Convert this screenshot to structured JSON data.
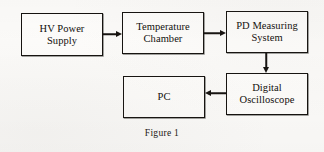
{
  "figure": {
    "caption": "Figure 1",
    "background_color": "#fbfaf8",
    "line_color": "#15120f",
    "box_fill_color": "#fdfcfa"
  },
  "blocks": [
    {
      "id": "hv-power-supply",
      "label": "HV Power\nSupply",
      "x": 21,
      "y": 13,
      "w": 82,
      "h": 43
    },
    {
      "id": "temperature-chamber",
      "label": "Temperature\nChamber",
      "x": 122,
      "y": 12,
      "w": 82,
      "h": 42
    },
    {
      "id": "pd-measuring-system",
      "label": "PD Measuring\nSystem",
      "x": 226,
      "y": 11,
      "w": 82,
      "h": 42
    },
    {
      "id": "digital-oscilloscope",
      "label": "Digital\nOscilloscope",
      "x": 226,
      "y": 73,
      "w": 82,
      "h": 42
    },
    {
      "id": "pc",
      "label": "PC",
      "x": 123,
      "y": 76,
      "w": 82,
      "h": 42
    }
  ],
  "arrows": [
    {
      "id": "hv-to-chamber",
      "from": "hv-power-supply",
      "to": "temperature-chamber",
      "direction": "right"
    },
    {
      "id": "chamber-to-pd",
      "from": "temperature-chamber",
      "to": "pd-measuring-system",
      "direction": "right"
    },
    {
      "id": "pd-to-oscilloscope",
      "from": "pd-measuring-system",
      "to": "digital-oscilloscope",
      "direction": "down"
    },
    {
      "id": "oscilloscope-to-pc",
      "from": "digital-oscilloscope",
      "to": "pc",
      "direction": "left"
    }
  ]
}
